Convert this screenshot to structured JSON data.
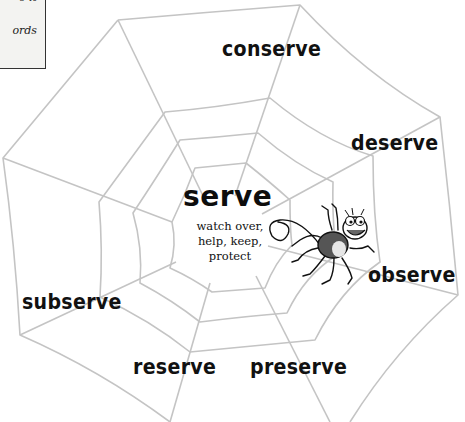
{
  "info_box": {
    "line1": "e it",
    "line2": "ords"
  },
  "top_caption": "",
  "web": {
    "center_word": "serve",
    "center_meaning_lines": [
      "watch over,",
      "help, keep,",
      "protect"
    ],
    "related_words": [
      {
        "id": "conserve",
        "label": "conserve"
      },
      {
        "id": "deserve",
        "label": "deserve"
      },
      {
        "id": "observe",
        "label": "observe"
      },
      {
        "id": "preserve",
        "label": "preserve"
      },
      {
        "id": "reserve",
        "label": "reserve"
      },
      {
        "id": "subserve",
        "label": "subserve"
      }
    ],
    "line_color": "#c4c4c4",
    "text_color": "#111111"
  },
  "illustration": {
    "spider": "cartoon-spider-icon",
    "body_color": "#555555",
    "belly_color": "#e6e6e6"
  }
}
